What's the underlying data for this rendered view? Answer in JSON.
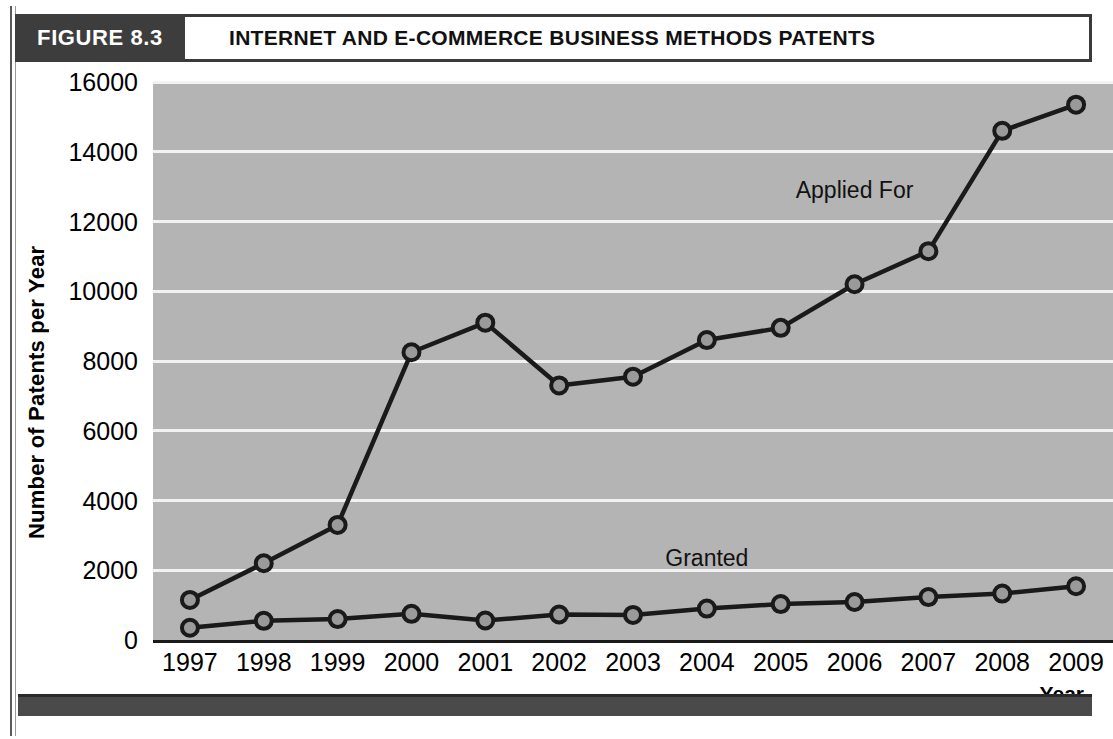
{
  "figure": {
    "tag": "FIGURE 8.3",
    "title": "INTERNET AND E-COMMERCE BUSINESS METHODS PATENTS"
  },
  "chart_data": {
    "type": "line",
    "title": "INTERNET AND E-COMMERCE BUSINESS METHODS PATENTS",
    "xlabel": "Year",
    "ylabel": "Number of Patents per Year",
    "categories": [
      "1997",
      "1998",
      "1999",
      "2000",
      "2001",
      "2002",
      "2003",
      "2004",
      "2005",
      "2006",
      "2007",
      "2008",
      "2009"
    ],
    "ylim": [
      0,
      16000
    ],
    "ytick_labels": [
      "0",
      "2000",
      "4000",
      "6000",
      "8000",
      "10000",
      "12000",
      "14000",
      "16000"
    ],
    "ytick_values": [
      0,
      2000,
      4000,
      6000,
      8000,
      10000,
      12000,
      14000,
      16000
    ],
    "grid": true,
    "legend_position": "inline-annotation",
    "plot_background": "#b4b4b4",
    "gridline_color": "#f2f2f2",
    "line_color": "#1a1a1a",
    "marker_fill": "#9a9a9a",
    "series": [
      {
        "name": "Applied For",
        "values": [
          1150,
          2200,
          3300,
          8250,
          9100,
          7300,
          7550,
          8600,
          8950,
          10200,
          11150,
          14600,
          15350
        ],
        "label_x_category": "2006",
        "label_y_value": 12900
      },
      {
        "name": "Granted",
        "values": [
          350,
          550,
          600,
          750,
          560,
          730,
          720,
          900,
          1030,
          1090,
          1230,
          1330,
          1540
        ],
        "label_x_category": "2004",
        "label_y_value": 2350
      }
    ]
  }
}
